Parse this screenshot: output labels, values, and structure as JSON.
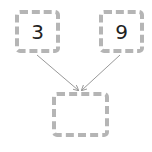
{
  "diagram": {
    "type": "number-bond",
    "boxes": [
      {
        "id": "top-left",
        "value": "3"
      },
      {
        "id": "top-right",
        "value": "9"
      },
      {
        "id": "bottom",
        "value": ""
      }
    ],
    "arrows": [
      {
        "from": "top-left",
        "to": "bottom"
      },
      {
        "from": "top-right",
        "to": "bottom"
      }
    ],
    "colors": {
      "border": "#b5b5b5",
      "arrow": "#999999",
      "text": "#222222"
    }
  }
}
